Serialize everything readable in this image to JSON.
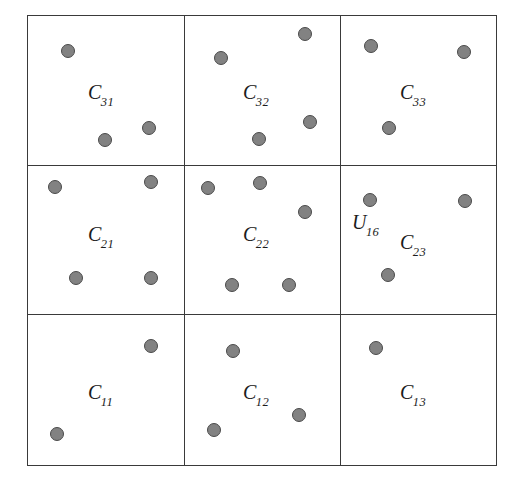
{
  "figure": {
    "type": "scatter-grid-diagram",
    "width": 517,
    "height": 497,
    "background_color": "#ffffff",
    "border_color": "#3a3a3a",
    "point_fill_color": "#828282",
    "point_stroke_color": "#4a4a4a",
    "label_color": "#1c1c1c"
  },
  "grid": {
    "rows": 3,
    "columns": 3,
    "left": 27,
    "top": 15,
    "right": 497,
    "bottom": 466,
    "vertical_line_x": [
      184,
      340
    ],
    "horizontal_line_y": [
      165,
      314
    ]
  },
  "cells": [
    {
      "id": "C31",
      "base": "C",
      "sub": "31",
      "row": 0,
      "col": 0,
      "label_x": 88,
      "label_y": 82
    },
    {
      "id": "C32",
      "base": "C",
      "sub": "32",
      "row": 0,
      "col": 1,
      "label_x": 243,
      "label_y": 82
    },
    {
      "id": "C33",
      "base": "C",
      "sub": "33",
      "row": 0,
      "col": 2,
      "label_x": 400,
      "label_y": 82
    },
    {
      "id": "C21",
      "base": "C",
      "sub": "21",
      "row": 1,
      "col": 0,
      "label_x": 88,
      "label_y": 224
    },
    {
      "id": "C22",
      "base": "C",
      "sub": "22",
      "row": 1,
      "col": 1,
      "label_x": 243,
      "label_y": 224
    },
    {
      "id": "C23",
      "base": "C",
      "sub": "23",
      "row": 1,
      "col": 2,
      "label_x": 400,
      "label_y": 232
    },
    {
      "id": "C11",
      "base": "C",
      "sub": "11",
      "row": 2,
      "col": 0,
      "label_x": 88,
      "label_y": 382
    },
    {
      "id": "C12",
      "base": "C",
      "sub": "12",
      "row": 2,
      "col": 1,
      "label_x": 243,
      "label_y": 382
    },
    {
      "id": "C13",
      "base": "C",
      "sub": "13",
      "row": 2,
      "col": 2,
      "label_x": 400,
      "label_y": 382
    }
  ],
  "points": [
    {
      "cell": "C31",
      "x": 68,
      "y": 51,
      "r": 7
    },
    {
      "cell": "C31",
      "x": 105,
      "y": 140,
      "r": 7
    },
    {
      "cell": "C31",
      "x": 149,
      "y": 128,
      "r": 7
    },
    {
      "cell": "C32",
      "x": 221,
      "y": 58,
      "r": 7
    },
    {
      "cell": "C32",
      "x": 305,
      "y": 34,
      "r": 7
    },
    {
      "cell": "C32",
      "x": 310,
      "y": 122,
      "r": 7
    },
    {
      "cell": "C32",
      "x": 259,
      "y": 139,
      "r": 7
    },
    {
      "cell": "C33",
      "x": 371,
      "y": 46,
      "r": 7
    },
    {
      "cell": "C33",
      "x": 464,
      "y": 52,
      "r": 7
    },
    {
      "cell": "C33",
      "x": 389,
      "y": 128,
      "r": 7
    },
    {
      "cell": "C21",
      "x": 55,
      "y": 187,
      "r": 7
    },
    {
      "cell": "C21",
      "x": 151,
      "y": 182,
      "r": 7
    },
    {
      "cell": "C21",
      "x": 76,
      "y": 278,
      "r": 7
    },
    {
      "cell": "C21",
      "x": 151,
      "y": 278,
      "r": 7
    },
    {
      "cell": "C22",
      "x": 208,
      "y": 188,
      "r": 7
    },
    {
      "cell": "C22",
      "x": 260,
      "y": 183,
      "r": 7
    },
    {
      "cell": "C22",
      "x": 305,
      "y": 212,
      "r": 7
    },
    {
      "cell": "C22",
      "x": 232,
      "y": 285,
      "r": 7
    },
    {
      "cell": "C22",
      "x": 289,
      "y": 285,
      "r": 7
    },
    {
      "cell": "C23",
      "x": 370,
      "y": 200,
      "r": 7,
      "label": "U16"
    },
    {
      "cell": "C23",
      "x": 465,
      "y": 201,
      "r": 7
    },
    {
      "cell": "C23",
      "x": 388,
      "y": 275,
      "r": 7
    },
    {
      "cell": "C11",
      "x": 151,
      "y": 346,
      "r": 7
    },
    {
      "cell": "C11",
      "x": 57,
      "y": 434,
      "r": 7
    },
    {
      "cell": "C12",
      "x": 233,
      "y": 351,
      "r": 7
    },
    {
      "cell": "C12",
      "x": 299,
      "y": 415,
      "r": 7
    },
    {
      "cell": "C12",
      "x": 214,
      "y": 430,
      "r": 7
    },
    {
      "cell": "C13",
      "x": 376,
      "y": 348,
      "r": 7
    }
  ],
  "point_labels": [
    {
      "id": "U16",
      "base": "U",
      "sub": "16",
      "x": 352,
      "y": 212
    }
  ]
}
